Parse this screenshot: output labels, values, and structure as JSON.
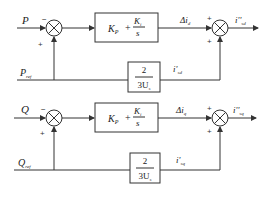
{
  "diagram": {
    "type": "control-block-diagram",
    "loops": [
      {
        "id": "d-axis",
        "input": "P",
        "reference": "P_ref",
        "input_sign": "−",
        "reference_sign": "+",
        "controller": {
          "kp": "K",
          "kp_sub": "P",
          "plus": "+",
          "ki": "K",
          "ki_sub": "i",
          "den": "s"
        },
        "feedforward": {
          "num": "2",
          "den": "3U",
          "den_sub": "s"
        },
        "controller_output": {
          "text": "Δi",
          "sub": "d"
        },
        "feedforward_output": {
          "text": "i'",
          "sub": "sd"
        },
        "output": {
          "text": "i''",
          "sub": "sd"
        },
        "sum_signs": [
          "+",
          "+"
        ]
      },
      {
        "id": "q-axis",
        "input": "Q",
        "reference": "Q_ref",
        "input_sign": "−",
        "reference_sign": "+",
        "controller": {
          "kp": "K",
          "kp_sub": "P",
          "plus": "+",
          "ki": "K",
          "ki_sub": "i",
          "den": "s"
        },
        "feedforward": {
          "num": "2",
          "den": "3U",
          "den_sub": "s"
        },
        "controller_output": {
          "text": "Δi",
          "sub": "q"
        },
        "feedforward_output": {
          "text": "i'",
          "sub": "sq"
        },
        "output": {
          "text": "i''",
          "sub": "sq"
        },
        "sum_signs": [
          "+",
          "+"
        ]
      }
    ],
    "labels": {
      "P_main": "P",
      "P_ref_main": "P",
      "P_ref_sub": "ref",
      "Q_main": "Q",
      "Q_ref_main": "Q",
      "Q_ref_sub": "ref"
    }
  }
}
